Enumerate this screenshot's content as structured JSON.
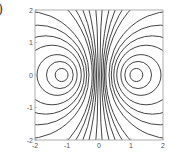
{
  "figure": {
    "panel_label": ")"
  },
  "chart_data": {
    "type": "contour",
    "title": "",
    "xlabel": "",
    "ylabel": "",
    "xlim": [
      -2,
      2
    ],
    "ylim": [
      -2,
      2
    ],
    "x_ticks": [
      "-2",
      "-1",
      "0",
      "1",
      "2"
    ],
    "y_ticks": [
      "2",
      "1",
      "0",
      "-1",
      "-2"
    ],
    "grid": false,
    "foci_x": 1.15,
    "ratio_levels": [
      0.087,
      0.176,
      0.255,
      0.35,
      0.428,
      0.5,
      0.573,
      0.689,
      0.747,
      0.811,
      0.876,
      0.962
    ],
    "line_color": "#444444",
    "frame_color": "#999999"
  }
}
